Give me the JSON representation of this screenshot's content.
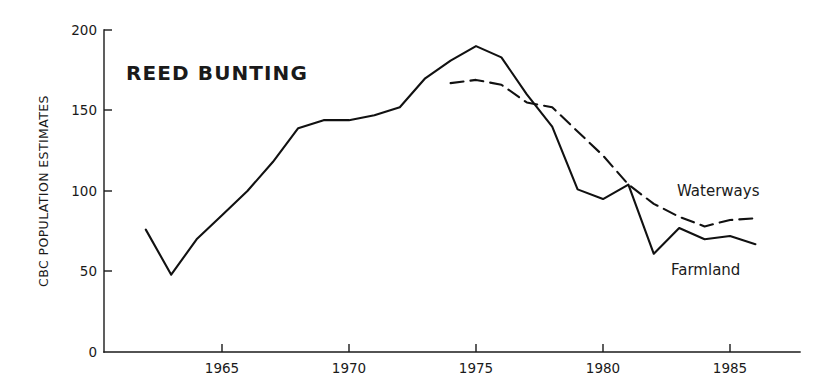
{
  "chart_data": {
    "type": "line",
    "title": "REED BUNTING",
    "xlabel": "",
    "ylabel": "CBC POPULATION ESTIMATES",
    "xlim": [
      1962,
      1986.5
    ],
    "ylim": [
      0,
      200
    ],
    "grid": false,
    "legend_position": "inline-annotations",
    "xticks": [
      1965,
      1970,
      1975,
      1980,
      1985
    ],
    "xtick_labels": [
      "1965",
      "1970",
      "1975",
      "1980",
      "1985"
    ],
    "yticks": [
      0,
      50,
      100,
      150,
      200
    ],
    "ytick_labels": [
      "0",
      "50",
      "100",
      "150",
      "200"
    ],
    "series": [
      {
        "name": "Farmland",
        "style": "solid",
        "color": "#111111",
        "label_position": "inline-right-lower",
        "x": [
          1962,
          1963,
          1964,
          1965,
          1966,
          1967,
          1968,
          1969,
          1970,
          1971,
          1972,
          1973,
          1974,
          1975,
          1976,
          1977,
          1978,
          1979,
          1980,
          1981,
          1982,
          1983,
          1984,
          1985,
          1986
        ],
        "values": [
          76,
          48,
          70,
          85,
          100,
          118,
          139,
          144,
          144,
          147,
          152,
          170,
          181,
          190,
          183,
          160,
          140,
          101,
          95,
          104,
          61,
          77,
          70,
          72,
          67
        ]
      },
      {
        "name": "Waterways",
        "style": "dashed",
        "color": "#111111",
        "label_position": "inline-right-upper",
        "x": [
          1974,
          1975,
          1976,
          1977,
          1978,
          1979,
          1980,
          1981,
          1982,
          1983,
          1984,
          1985,
          1986
        ],
        "values": [
          167,
          169,
          166,
          155,
          152,
          137,
          122,
          104,
          92,
          84,
          78,
          82,
          83
        ]
      }
    ]
  },
  "annotations": {
    "waterways_label": "Waterways",
    "farmland_label": "Farmland"
  }
}
